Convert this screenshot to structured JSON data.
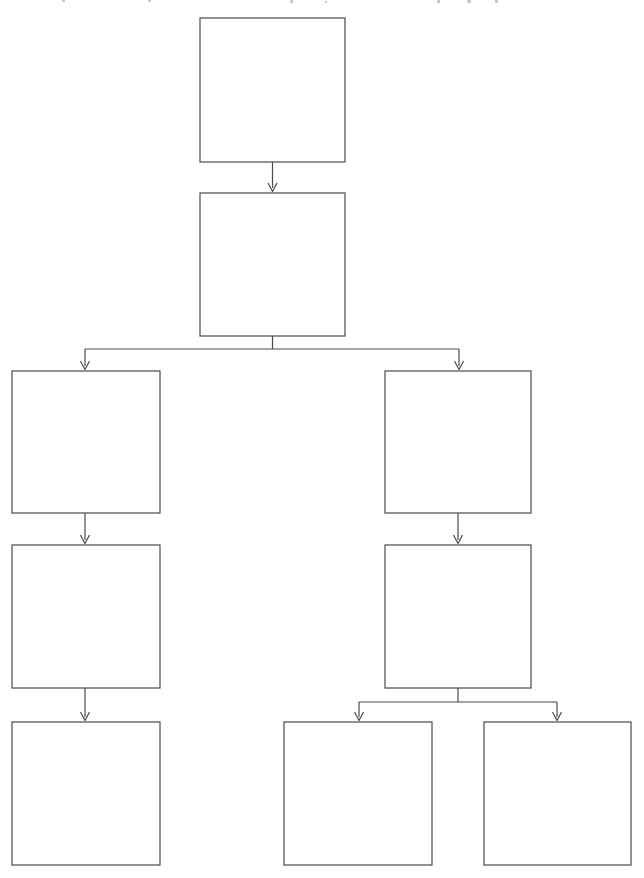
{
  "page": {
    "width": 644,
    "height": 878,
    "background_color": "#ffffff"
  },
  "style": {
    "box_stroke_color": "#4a4a4a",
    "box_fill_color": "#ffffff",
    "box_stroke_width": 1.2,
    "connector_stroke_color": "#4a4a4a",
    "connector_stroke_width": 1.2,
    "arrow_head_size": 5
  },
  "diagram": {
    "type": "flowchart-tree",
    "orientation": "top-down",
    "node_count": 9,
    "edge_count": 8,
    "all_nodes_empty": true,
    "nodes": [
      {
        "id": "node-1",
        "label": "",
        "x": 200,
        "y": 18,
        "width": 145,
        "height": 144,
        "column": "center",
        "level": 0
      },
      {
        "id": "node-2",
        "label": "",
        "x": 200,
        "y": 193,
        "width": 145,
        "height": 143,
        "column": "center",
        "level": 1
      },
      {
        "id": "node-3",
        "label": "",
        "x": 12,
        "y": 371,
        "width": 148,
        "height": 142,
        "column": "left",
        "level": 2
      },
      {
        "id": "node-4",
        "label": "",
        "x": 12,
        "y": 545,
        "width": 148,
        "height": 143,
        "column": "left",
        "level": 3
      },
      {
        "id": "node-5",
        "label": "",
        "x": 12,
        "y": 722,
        "width": 148,
        "height": 143,
        "column": "left",
        "level": 4
      },
      {
        "id": "node-6",
        "label": "",
        "x": 385,
        "y": 371,
        "width": 146,
        "height": 142,
        "column": "right",
        "level": 2
      },
      {
        "id": "node-7",
        "label": "",
        "x": 385,
        "y": 545,
        "width": 146,
        "height": 143,
        "column": "right",
        "level": 3
      },
      {
        "id": "node-8",
        "label": "",
        "x": 284,
        "y": 722,
        "width": 148,
        "height": 143,
        "column": "right-a",
        "level": 4
      },
      {
        "id": "node-9",
        "label": "",
        "x": 484,
        "y": 722,
        "width": 147,
        "height": 143,
        "column": "right-b",
        "level": 4
      }
    ],
    "edges": [
      {
        "id": "edge-1-2",
        "from": "node-1",
        "to": "node-2",
        "shape": "straight",
        "label": ""
      },
      {
        "id": "edge-2-3",
        "from": "node-2",
        "to": "node-3",
        "shape": "elbow-left",
        "label": ""
      },
      {
        "id": "edge-2-6",
        "from": "node-2",
        "to": "node-6",
        "shape": "elbow-right",
        "label": ""
      },
      {
        "id": "edge-3-4",
        "from": "node-3",
        "to": "node-4",
        "shape": "straight",
        "label": ""
      },
      {
        "id": "edge-4-5",
        "from": "node-4",
        "to": "node-5",
        "shape": "straight",
        "label": ""
      },
      {
        "id": "edge-6-7",
        "from": "node-6",
        "to": "node-7",
        "shape": "straight",
        "label": ""
      },
      {
        "id": "edge-7-8",
        "from": "node-7",
        "to": "node-8",
        "shape": "elbow-left",
        "label": ""
      },
      {
        "id": "edge-7-9",
        "from": "node-7",
        "to": "node-9",
        "shape": "elbow-right",
        "label": ""
      }
    ],
    "branch_buses": [
      {
        "id": "bus-upper",
        "y": 349,
        "from_x": 85,
        "to_x": 459,
        "source": "node-2"
      },
      {
        "id": "bus-lower",
        "y": 702,
        "from_x": 359,
        "to_x": 557,
        "source": "node-7"
      }
    ]
  }
}
